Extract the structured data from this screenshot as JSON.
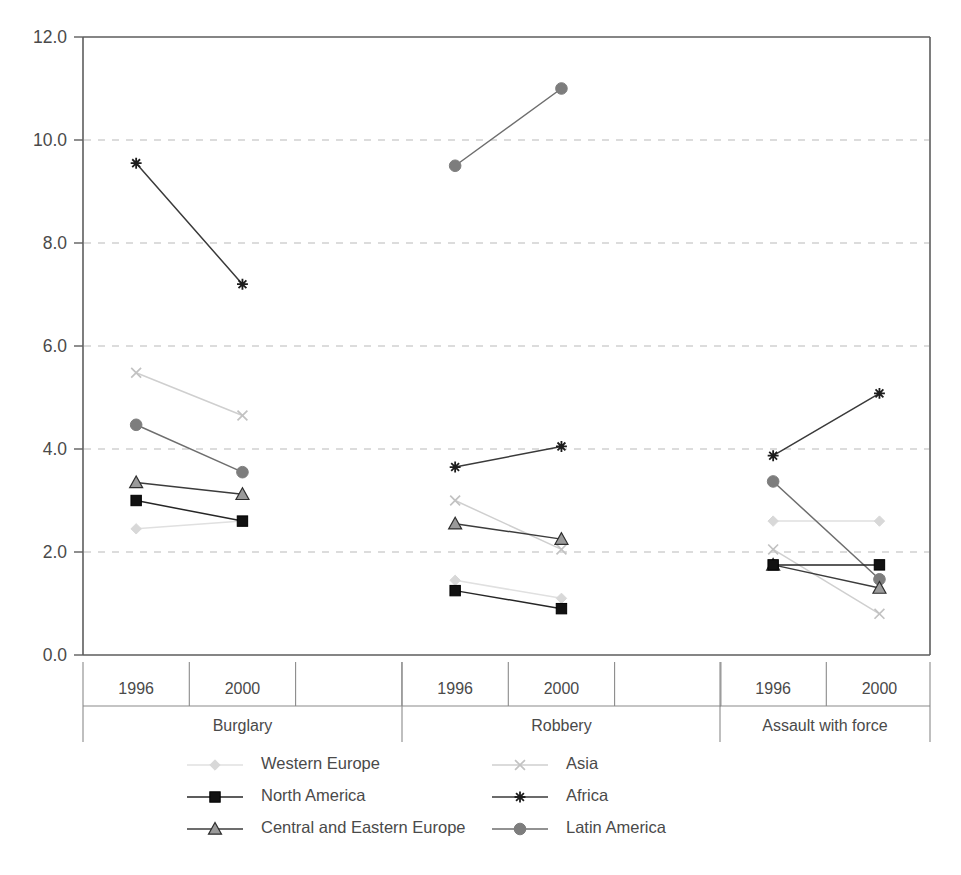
{
  "chart_data": {
    "type": "line",
    "title": "",
    "subtitle": "",
    "xlabel": "",
    "ylabel": "",
    "ylim": [
      0.0,
      12.0
    ],
    "ytick_labels": [
      "0.0",
      "2.0",
      "4.0",
      "6.0",
      "8.0",
      "10.0",
      "12.0"
    ],
    "ytick_values": [
      0,
      2,
      4,
      6,
      8,
      10,
      12
    ],
    "grid": "horizontal-dashed",
    "legend_position": "bottom",
    "groups": [
      "Burglary",
      "Robbery",
      "Assault with force"
    ],
    "categories": [
      "1996",
      "2000"
    ],
    "x": [
      "Burglary 1996",
      "Burglary 2000",
      "Robbery 1996",
      "Robbery 2000",
      "Assault with force 1996",
      "Assault with force 2000"
    ],
    "series": [
      {
        "name": "Western Europe",
        "marker": "diamond",
        "color": "#d8d8d8",
        "line_color": "#e0e0e0",
        "values_by_group": {
          "Burglary": [
            2.45,
            2.6
          ],
          "Robbery": [
            1.45,
            1.1
          ],
          "Assault with force": [
            2.6,
            2.6
          ]
        }
      },
      {
        "name": "North America",
        "marker": "square",
        "color": "#111111",
        "line_color": "#262626",
        "values_by_group": {
          "Burglary": [
            3.0,
            2.6
          ],
          "Robbery": [
            1.25,
            0.9
          ],
          "Assault with force": [
            1.75,
            1.75
          ]
        }
      },
      {
        "name": "Central and Eastern Europe",
        "marker": "triangle",
        "color": "#9a9a9a",
        "line_color": "#3c3c3c",
        "values_by_group": {
          "Burglary": [
            3.35,
            3.12
          ],
          "Robbery": [
            2.55,
            2.25
          ],
          "Assault with force": [
            1.75,
            1.3
          ]
        }
      },
      {
        "name": "Asia",
        "marker": "x",
        "color": "#c2c2c2",
        "line_color": "#cfcfcf",
        "values_by_group": {
          "Burglary": [
            5.48,
            4.65
          ],
          "Robbery": [
            3.0,
            2.05
          ],
          "Assault with force": [
            2.05,
            0.8
          ]
        }
      },
      {
        "name": "Africa",
        "marker": "asterisk",
        "color": "#1d1d1d",
        "line_color": "#3a3a3a",
        "values_by_group": {
          "Burglary": [
            9.55,
            7.2
          ],
          "Robbery": [
            3.65,
            4.05
          ],
          "Assault with force": [
            3.87,
            5.08
          ]
        }
      },
      {
        "name": "Latin America",
        "marker": "circle",
        "color": "#7d7d7d",
        "line_color": "#6e6e6e",
        "values_by_group": {
          "Burglary": [
            4.47,
            3.55
          ],
          "Robbery": [
            9.5,
            11.0
          ],
          "Assault with force": [
            3.37,
            1.47
          ]
        }
      }
    ],
    "legend": [
      {
        "label": "Western Europe",
        "marker": "diamond",
        "color": "#d8d8d8"
      },
      {
        "label": "North America",
        "marker": "square",
        "color": "#111111"
      },
      {
        "label": "Central and Eastern Europe",
        "marker": "triangle",
        "color": "#9a9a9a"
      },
      {
        "label": "Asia",
        "marker": "x",
        "color": "#c2c2c2"
      },
      {
        "label": "Africa",
        "marker": "asterisk",
        "color": "#1d1d1d"
      },
      {
        "label": "Latin America",
        "marker": "circle",
        "color": "#7d7d7d"
      }
    ]
  },
  "axis": {
    "y_labels": [
      "12.0",
      "10.0",
      "8.0",
      "6.0",
      "4.0",
      "2.0",
      "0.0"
    ],
    "x_group_cells": [
      {
        "group": "Burglary",
        "years": [
          "1996",
          "2000"
        ]
      },
      {
        "group": "Robbery",
        "years": [
          "1996",
          "2000"
        ]
      },
      {
        "group": "Assault with force",
        "years": [
          "1996",
          "2000"
        ]
      }
    ]
  }
}
